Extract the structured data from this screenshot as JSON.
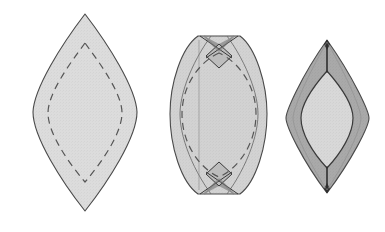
{
  "figure": {
    "title": "Leaf-shaped lens pattern construction diagram",
    "canvas": {
      "width": 385,
      "height": 232,
      "background": "#ffffff"
    },
    "palette": {
      "fill_light": "#dcdcdc",
      "fill_mid": "#c9c9c9",
      "fill_dark": "#a9a9a9",
      "fill_notch": "#9a9a9a",
      "outline": "#4a4a4a",
      "dashed_line": "#555555",
      "crease_line": "#3a3a3a"
    },
    "shapes": [
      {
        "index": 1,
        "name": "pointed-lens-with-dashed-seam",
        "label": "Shape 1 - pointed leaf with dashed inner seam line",
        "bbox": {
          "x": 33,
          "y": 14,
          "width": 104,
          "height": 198
        },
        "fill": "#dcdcdc",
        "outline": "#4a4a4a",
        "has_dashed_inner": true,
        "dash_pattern": "7,5",
        "notches": 0
      },
      {
        "index": 2,
        "name": "flat-top-lens-with-dart-notches",
        "label": "Shape 2 - lens with flattened top and bottom, dart notches and dashed seam",
        "bbox": {
          "x": 170,
          "y": 36,
          "width": 97,
          "height": 158
        },
        "fill": "#d2d2d2",
        "outline": "#4a4a4a",
        "has_dashed_inner": true,
        "dash_pattern": "7,5",
        "notches": 2,
        "notch_fill": "#9a9a9a",
        "notch_positions": [
          "top",
          "bottom"
        ]
      },
      {
        "index": 3,
        "name": "two-tone-lens-with-inner-leaf",
        "label": "Shape 3 - narrow lens with dark outer band and light inner leaf",
        "bbox": {
          "x": 285,
          "y": 40,
          "width": 85,
          "height": 153
        },
        "outer_fill": "#a9a9a9",
        "inner_fill": "#d8d8d8",
        "outline": "#4a4a4a",
        "has_dashed_inner": false,
        "notches": 0,
        "tip_creases": [
          "top",
          "bottom"
        ]
      }
    ]
  }
}
